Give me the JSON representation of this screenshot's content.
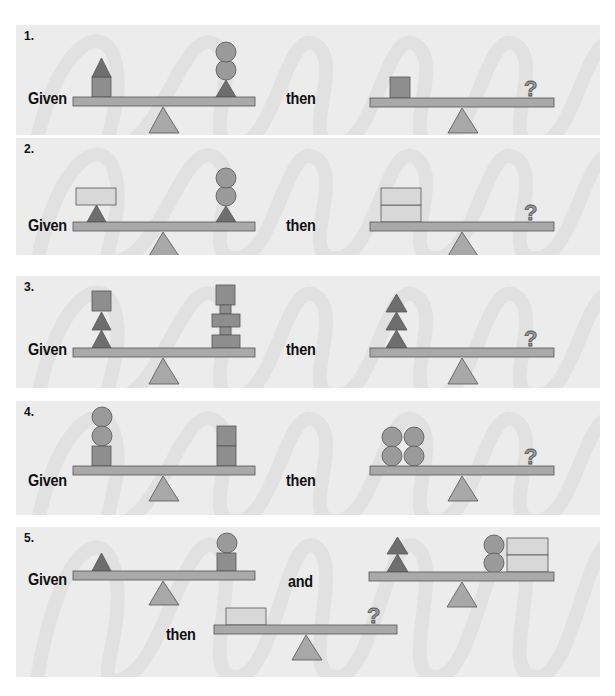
{
  "colors": {
    "panel_bg": "#ececec",
    "beam": "#a9a9a9",
    "fulcrum": "#a8a8a8",
    "dark_triangle": "#6e6e6e",
    "square": "#8e8e8e",
    "circle": "#9a9a9a",
    "light_rect": "#d8d8d8",
    "question": "#9a9a9a"
  },
  "problems": [
    {
      "number": "1.",
      "given_label": "Given",
      "then_label": "then",
      "given": {
        "left": [
          "square",
          "triangle"
        ],
        "right": [
          "triangle",
          "circle",
          "circle"
        ]
      },
      "question": {
        "left": [
          "square"
        ],
        "right": [
          "?"
        ]
      }
    },
    {
      "number": "2.",
      "given_label": "Given",
      "then_label": "then",
      "given": {
        "left": [
          "triangle",
          "light-rectangle"
        ],
        "right": [
          "triangle",
          "circle",
          "circle"
        ]
      },
      "question": {
        "left": [
          "light-rectangle",
          "light-rectangle"
        ],
        "right": [
          "?"
        ]
      }
    },
    {
      "number": "3.",
      "given_label": "Given",
      "then_label": "then",
      "given": {
        "left": [
          "triangle",
          "triangle",
          "square"
        ],
        "right": [
          "spool",
          "spool",
          "square"
        ]
      },
      "question": {
        "left": [
          "triangle",
          "triangle",
          "triangle"
        ],
        "right": [
          "?"
        ]
      }
    },
    {
      "number": "4.",
      "given_label": "Given",
      "then_label": "then",
      "given": {
        "left": [
          "square",
          "circle",
          "circle"
        ],
        "right": [
          "square",
          "square"
        ]
      },
      "question": {
        "left": [
          "circle",
          "circle",
          "circle",
          "circle"
        ],
        "right": [
          "?"
        ]
      }
    },
    {
      "number": "5.",
      "given_label": "Given",
      "and_label": "and",
      "then_label": "then",
      "given": {
        "left": [
          "triangle"
        ],
        "right": [
          "square",
          "circle"
        ]
      },
      "given2": {
        "left": [
          "triangle",
          "triangle"
        ],
        "right": [
          "circle",
          "circle",
          "light-rectangle",
          "light-rectangle"
        ]
      },
      "question": {
        "left": [
          "light-rectangle"
        ],
        "right": [
          "?"
        ]
      }
    }
  ],
  "question_mark": "?"
}
